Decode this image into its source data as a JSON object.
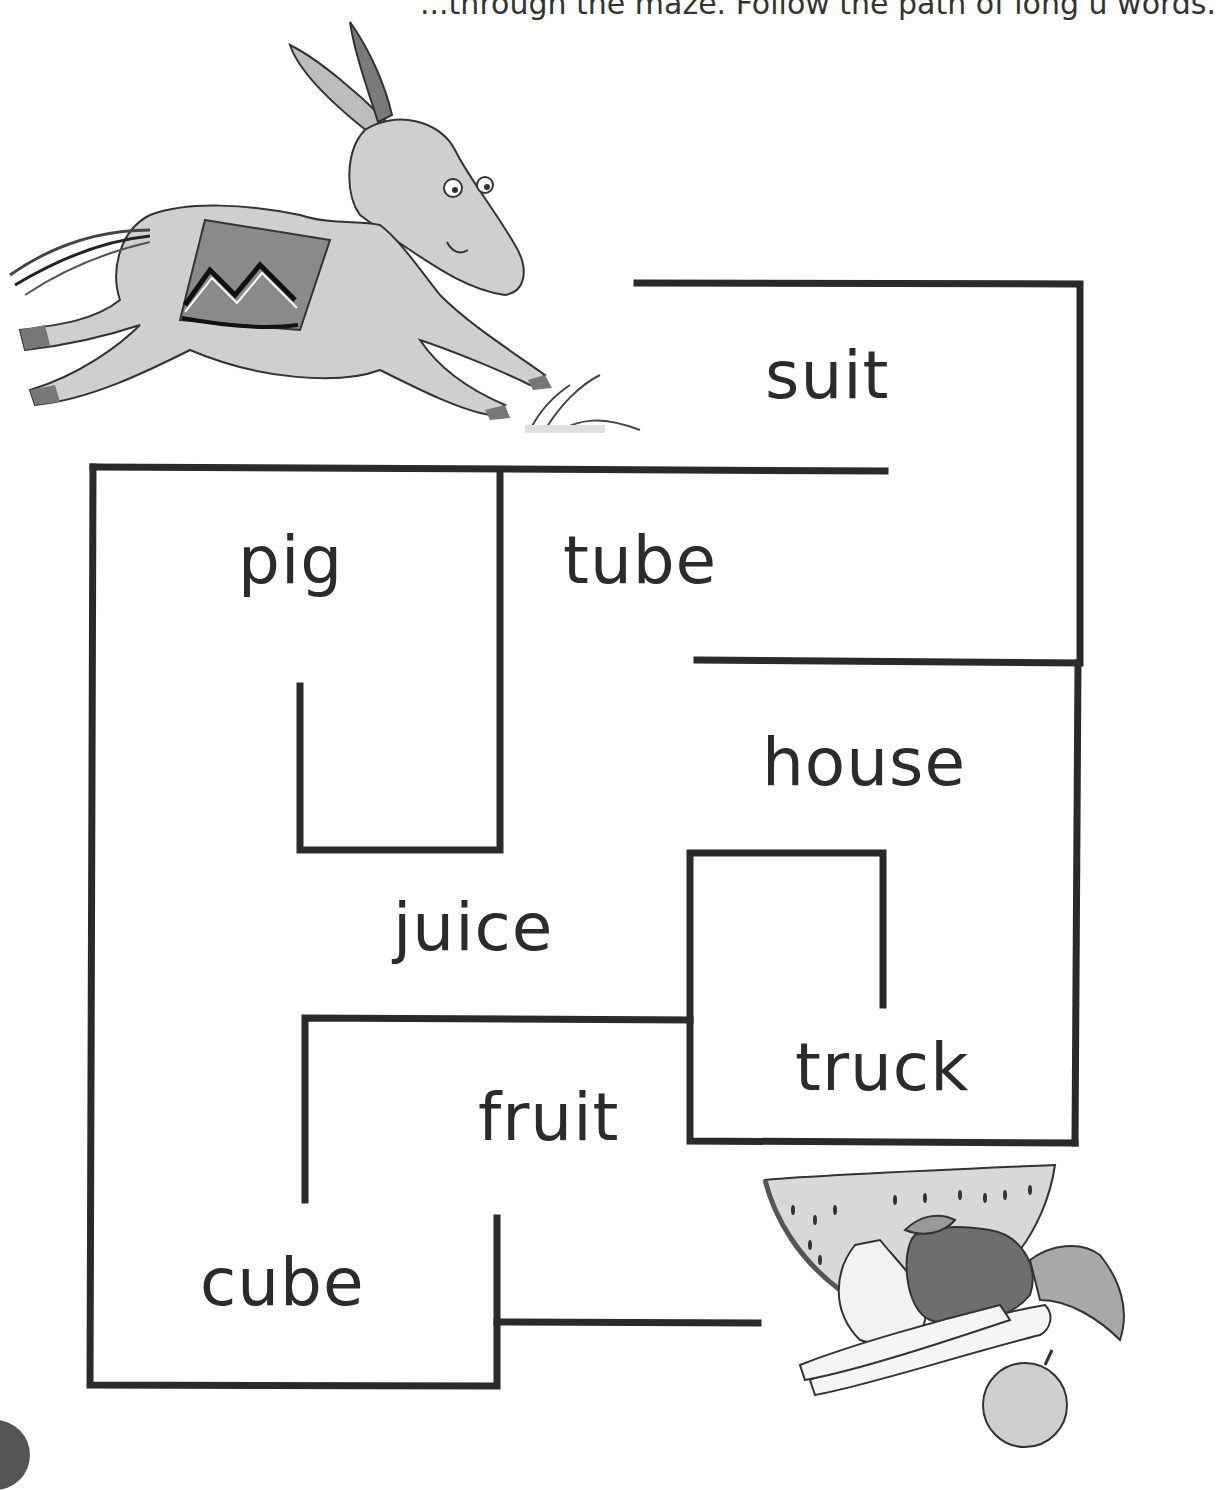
{
  "instructions": "...through the maze. Follow the path of long u words.",
  "maze": {
    "start_label": "donkey",
    "end_label": "fruit-and-vegetables",
    "stroke_color": "#2a2a2a",
    "words": [
      {
        "id": "suit",
        "text": "suit"
      },
      {
        "id": "pig",
        "text": "pig"
      },
      {
        "id": "tube",
        "text": "tube"
      },
      {
        "id": "house",
        "text": "house"
      },
      {
        "id": "juice",
        "text": "juice"
      },
      {
        "id": "truck",
        "text": "truck"
      },
      {
        "id": "fruit",
        "text": "fruit"
      },
      {
        "id": "cube",
        "text": "cube"
      }
    ]
  }
}
